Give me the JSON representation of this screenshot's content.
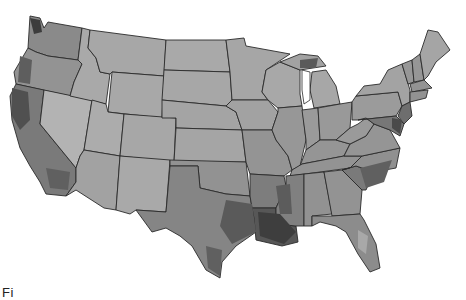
{
  "map": {
    "type": "choropleth",
    "region": "Contiguous United States",
    "unit": "county",
    "color_scale": "grayscale",
    "colors": {
      "lightest": "#b8b8b8",
      "light": "#a6a6a6",
      "medium": "#8f8f8f",
      "dark": "#6e6e6e",
      "darkest": "#3e3e3e",
      "border": "#2a2a2a",
      "background": "#ffffff"
    },
    "regions": [
      {
        "id": "WA",
        "shade": "dark"
      },
      {
        "id": "OR",
        "shade": "medium"
      },
      {
        "id": "CA",
        "shade": "dark"
      },
      {
        "id": "NV",
        "shade": "lightest"
      },
      {
        "id": "ID",
        "shade": "light"
      },
      {
        "id": "MT",
        "shade": "light"
      },
      {
        "id": "WY",
        "shade": "light"
      },
      {
        "id": "UT",
        "shade": "light"
      },
      {
        "id": "AZ",
        "shade": "light"
      },
      {
        "id": "CO",
        "shade": "light"
      },
      {
        "id": "NM",
        "shade": "light"
      },
      {
        "id": "ND",
        "shade": "light"
      },
      {
        "id": "SD",
        "shade": "light"
      },
      {
        "id": "NE",
        "shade": "light"
      },
      {
        "id": "KS",
        "shade": "light"
      },
      {
        "id": "OK",
        "shade": "medium"
      },
      {
        "id": "TX",
        "shade": "medium"
      },
      {
        "id": "MN",
        "shade": "light"
      },
      {
        "id": "IA",
        "shade": "light"
      },
      {
        "id": "MO",
        "shade": "medium"
      },
      {
        "id": "AR",
        "shade": "dark"
      },
      {
        "id": "LA",
        "shade": "darkest"
      },
      {
        "id": "WI",
        "shade": "light"
      },
      {
        "id": "IL",
        "shade": "medium"
      },
      {
        "id": "MI",
        "shade": "light"
      },
      {
        "id": "IN",
        "shade": "medium"
      },
      {
        "id": "OH",
        "shade": "medium"
      },
      {
        "id": "KY",
        "shade": "medium"
      },
      {
        "id": "TN",
        "shade": "medium"
      },
      {
        "id": "MS",
        "shade": "dark"
      },
      {
        "id": "AL",
        "shade": "medium"
      },
      {
        "id": "GA",
        "shade": "medium"
      },
      {
        "id": "FL",
        "shade": "medium"
      },
      {
        "id": "SC",
        "shade": "dark"
      },
      {
        "id": "NC",
        "shade": "medium"
      },
      {
        "id": "VA",
        "shade": "medium"
      },
      {
        "id": "WV",
        "shade": "medium"
      },
      {
        "id": "PA",
        "shade": "medium"
      },
      {
        "id": "NY",
        "shade": "light"
      },
      {
        "id": "VT",
        "shade": "medium"
      },
      {
        "id": "NH",
        "shade": "medium"
      },
      {
        "id": "ME",
        "shade": "light"
      },
      {
        "id": "MA",
        "shade": "medium"
      },
      {
        "id": "CT",
        "shade": "medium"
      },
      {
        "id": "NJ",
        "shade": "dark"
      },
      {
        "id": "MD",
        "shade": "dark"
      },
      {
        "id": "DE",
        "shade": "dark"
      }
    ]
  },
  "caption": {
    "text": "Fi"
  }
}
